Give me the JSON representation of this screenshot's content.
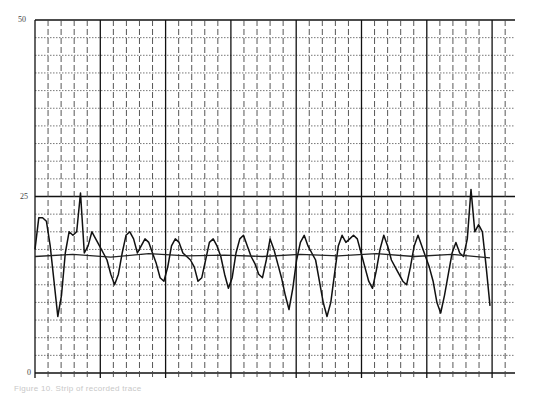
{
  "chart_data": {
    "type": "line",
    "title": "",
    "xlabel": "",
    "ylabel": "",
    "ylim": [
      0,
      50
    ],
    "y_ticks": [
      "0",
      "25",
      "50"
    ],
    "y_tick_values": [
      0,
      25,
      50
    ],
    "grid": {
      "major_vertical_count": 8,
      "minor_vertical_per_major": 4,
      "horizontal_minor_step": 2.5,
      "horizontal_major_lines": [
        0,
        25,
        50
      ]
    },
    "legend": null,
    "series": [
      {
        "name": "signal trace",
        "x": [
          0,
          1,
          2,
          3,
          4,
          5,
          6,
          7,
          8,
          9,
          10,
          11,
          12,
          13,
          14,
          15,
          16,
          17,
          18,
          19,
          20,
          21,
          22,
          23,
          24,
          25,
          26,
          27,
          28,
          29,
          30,
          31,
          32,
          33,
          34,
          35,
          36,
          37,
          38,
          39,
          40,
          41,
          42,
          43,
          44,
          45,
          46,
          47,
          48,
          49,
          50,
          51,
          52,
          53,
          54,
          55,
          56,
          57,
          58,
          59,
          60,
          61,
          62,
          63,
          64,
          65,
          66,
          67,
          68,
          69,
          70,
          71,
          72,
          73,
          74,
          75,
          76,
          77,
          78,
          79,
          80,
          81,
          82,
          83,
          84,
          85,
          86,
          87,
          88,
          89,
          90,
          91,
          92,
          93,
          94,
          95,
          96,
          97,
          98,
          99,
          100,
          101,
          102,
          103,
          104,
          105,
          106,
          107,
          108,
          109,
          110,
          111,
          112,
          113,
          114,
          115,
          116,
          117,
          118,
          119,
          120
        ],
        "values": [
          17.5,
          22,
          22,
          21.5,
          18,
          13,
          8,
          11,
          17,
          20,
          19.5,
          20,
          25.5,
          17,
          18,
          20,
          19,
          18,
          17,
          16,
          14,
          12.5,
          14,
          17,
          19.5,
          20,
          19,
          17,
          18,
          19,
          18.5,
          17,
          15.5,
          13.5,
          13,
          15,
          18,
          19,
          18.5,
          17,
          16.5,
          16,
          15,
          13,
          13.5,
          16,
          18.5,
          19,
          18,
          16.5,
          14,
          12,
          13.5,
          17,
          19,
          19.5,
          18,
          16.5,
          15.5,
          14,
          13.5,
          16,
          19,
          17.5,
          15.5,
          13.5,
          11,
          9,
          12,
          16,
          18.5,
          19.5,
          18,
          17,
          16,
          13,
          10,
          8,
          10,
          14,
          18,
          19.5,
          18.5,
          19,
          19.5,
          19,
          17,
          15,
          13,
          12,
          14.5,
          17.5,
          19.5,
          18,
          16,
          15,
          14,
          13,
          12.5,
          15,
          18,
          19.5,
          18,
          16.5,
          15,
          13,
          10,
          8.5,
          11,
          14,
          17,
          18.5,
          17,
          16.5,
          19,
          26,
          20,
          21,
          20,
          15,
          9.5
        ],
        "color": "#111111"
      },
      {
        "name": "baseline",
        "x": [
          0,
          10,
          20,
          30,
          40,
          50,
          60,
          70,
          80,
          90,
          100,
          110,
          120
        ],
        "values": [
          16.5,
          16.8,
          16.4,
          16.9,
          16.6,
          16.7,
          16.5,
          16.8,
          16.6,
          16.9,
          16.5,
          16.8,
          16.3
        ],
        "color": "#222222"
      }
    ]
  },
  "caption": "Figure 10.  Strip of recorded trace"
}
